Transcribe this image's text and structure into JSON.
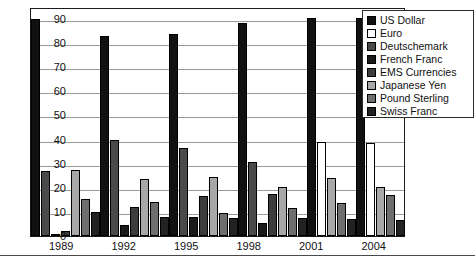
{
  "chart_data": {
    "type": "bar",
    "title": "",
    "xlabel": "",
    "ylabel": "",
    "ylim": [
      0,
      95
    ],
    "grid": true,
    "legend_position": "top-right",
    "categories": [
      "1989",
      "1992",
      "1995",
      "1998",
      "2001",
      "2004"
    ],
    "yticks": [
      0,
      10,
      20,
      30,
      40,
      50,
      60,
      70,
      80,
      90
    ],
    "series": [
      {
        "name": "US Dollar",
        "color": "#111111",
        "values": [
          90,
          83,
          84,
          88.5,
          90.5,
          90.5
        ]
      },
      {
        "name": "Euro",
        "color": "#ffffff",
        "values": [
          null,
          null,
          null,
          null,
          39,
          38.5
        ]
      },
      {
        "name": "Deutschemark",
        "color": "#4a4a4a",
        "values": [
          27,
          40,
          36.5,
          30.5,
          null,
          null
        ]
      },
      {
        "name": "French Franc",
        "color": "#1a1a1a",
        "values": [
          1,
          4.5,
          8,
          5.5,
          null,
          null
        ]
      },
      {
        "name": "EMS Currencies",
        "color": "#3c3c3c",
        "values": [
          2,
          12,
          16.5,
          17.5,
          null,
          null
        ]
      },
      {
        "name": "Japanese Yen",
        "color": "#a8a8a8",
        "values": [
          27.5,
          23.5,
          24.5,
          20.5,
          24,
          20.5
        ]
      },
      {
        "name": "Pound Sterling",
        "color": "#6e6e6e",
        "values": [
          15.5,
          14,
          9.5,
          11.5,
          13.5,
          17
        ]
      },
      {
        "name": "Swiss Franc",
        "color": "#222222",
        "values": [
          10,
          8,
          7.5,
          7.5,
          7,
          6.5
        ]
      }
    ]
  },
  "legend": {
    "items": [
      {
        "label": "US Dollar"
      },
      {
        "label": "Euro"
      },
      {
        "label": "Deutschemark"
      },
      {
        "label": "French Franc"
      },
      {
        "label": "EMS Currencies"
      },
      {
        "label": "Japanese Yen"
      },
      {
        "label": "Pound Sterling"
      },
      {
        "label": "Swiss Franc"
      }
    ]
  }
}
